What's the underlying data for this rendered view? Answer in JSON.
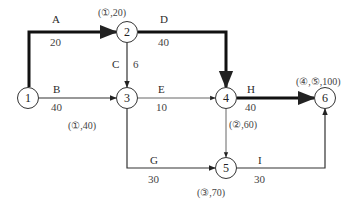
{
  "diagram": {
    "type": "network-diagram",
    "nodes": [
      {
        "id": "1",
        "label": "1"
      },
      {
        "id": "2",
        "label": "2"
      },
      {
        "id": "3",
        "label": "3"
      },
      {
        "id": "4",
        "label": "4"
      },
      {
        "id": "5",
        "label": "5"
      },
      {
        "id": "6",
        "label": "6"
      }
    ],
    "edges": [
      {
        "id": "A",
        "from": "1",
        "to": "2",
        "label": "A",
        "weight": "20",
        "critical": true
      },
      {
        "id": "B",
        "from": "1",
        "to": "3",
        "label": "B",
        "weight": "40",
        "critical": false
      },
      {
        "id": "C",
        "from": "2",
        "to": "3",
        "label": "C",
        "weight": "6",
        "critical": false
      },
      {
        "id": "D",
        "from": "2",
        "to": "4",
        "label": "D",
        "weight": "40",
        "critical": true
      },
      {
        "id": "E",
        "from": "3",
        "to": "4",
        "label": "E",
        "weight": "10",
        "critical": false
      },
      {
        "id": "G",
        "from": "3",
        "to": "5",
        "label": "G",
        "weight": "30",
        "critical": false
      },
      {
        "id": "H",
        "from": "4",
        "to": "6",
        "label": "H",
        "weight": "40",
        "critical": true
      },
      {
        "id": "I",
        "from": "5",
        "to": "6",
        "label": "I",
        "weight": "30",
        "critical": false
      },
      {
        "id": "45",
        "from": "4",
        "to": "5",
        "label": "",
        "weight": "",
        "critical": false
      }
    ],
    "annotations": {
      "node2": "(①,20)",
      "node3": "(①,40)",
      "node4": "(②,60)",
      "node5": "(③,70)",
      "node6": "(④,⑤,100)"
    },
    "colors": {
      "line": "#333333",
      "critical": "#111111",
      "text": "#2a2a2a"
    }
  }
}
